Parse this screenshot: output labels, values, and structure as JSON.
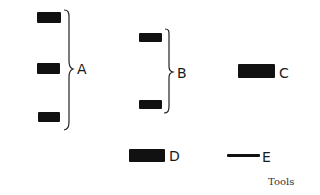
{
  "diagram": {
    "caption": "Tools",
    "groups": [
      {
        "id": "A",
        "label": "A",
        "item_count": 3
      },
      {
        "id": "B",
        "label": "B",
        "item_count": 2
      },
      {
        "id": "C",
        "label": "C",
        "item_count": 1
      },
      {
        "id": "D",
        "label": "D",
        "item_count": 1
      },
      {
        "id": "E",
        "label": "E",
        "item_count": 1
      }
    ],
    "colors": {
      "ink": "#111111",
      "background": "#ffffff"
    }
  }
}
